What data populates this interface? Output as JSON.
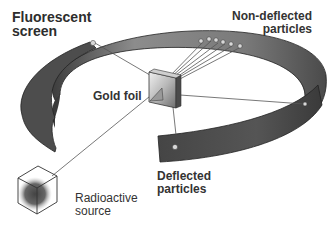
{
  "diagram": {
    "labels": {
      "screen": "Fluorescent\nscreen",
      "non_deflected": "Non-deflected\nparticles",
      "gold_foil": "Gold foil",
      "deflected": "Deflected\nparticles",
      "source": "Radioactive\nsource"
    },
    "colors": {
      "screen_outer": "#5a5a5a",
      "screen_inner": "#8a8a8a",
      "foil": "#bdbdbd",
      "source_glow": "#555555",
      "lines": "#444444",
      "text": "#333333"
    },
    "components": [
      "Fluorescent screen",
      "Gold foil",
      "Radioactive source",
      "Non-deflected particles",
      "Deflected particles"
    ]
  }
}
